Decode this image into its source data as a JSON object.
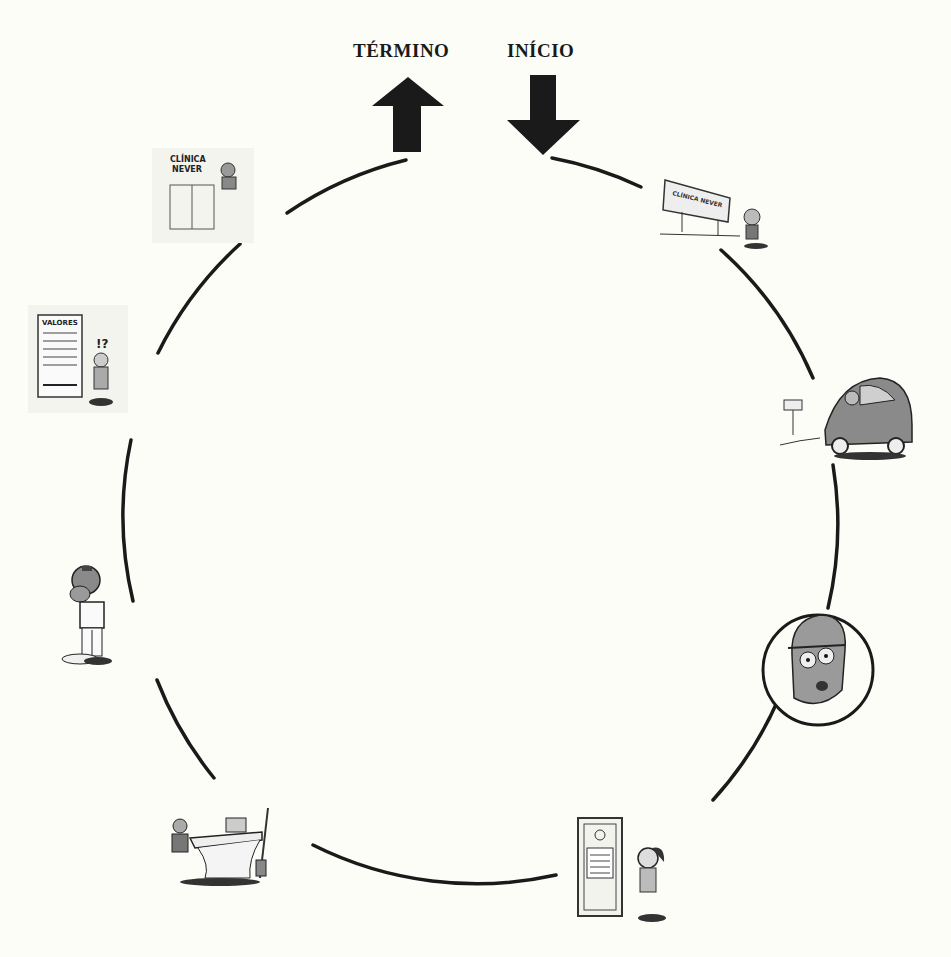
{
  "diagram": {
    "type": "cycle",
    "labels": {
      "end": "TÉRMINO",
      "start": "INÍCIO"
    },
    "circle": {
      "cx": 483,
      "cy": 517,
      "r": 365,
      "stroke": "#1a1a1a"
    },
    "steps": [
      {
        "id": 1,
        "name": "billboard",
        "caption_text": "CLÍNICA NEVER",
        "description": "Man looks at Clínica Never billboard"
      },
      {
        "id": 2,
        "name": "car-arrival",
        "caption_text": "",
        "description": "Man drives car toward parking sign"
      },
      {
        "id": 3,
        "name": "worried-face",
        "caption_text": "",
        "description": "Close-up of worried face in circle"
      },
      {
        "id": 4,
        "name": "waiting-door",
        "caption_text": "",
        "description": "Anxious man waits at office door with notice"
      },
      {
        "id": 5,
        "name": "reception-desk",
        "caption_text": "",
        "description": "Receptionist sitting at desk"
      },
      {
        "id": 6,
        "name": "dentist-standing",
        "caption_text": "",
        "description": "Professional standing with head lamp"
      },
      {
        "id": 7,
        "name": "price-board",
        "caption_text": "VALORES",
        "description": "Man shocked by price board"
      },
      {
        "id": 8,
        "name": "clinic-entrance",
        "caption_text": "CLÍNICA NEVER",
        "description": "Man leaves from Clínica Never entrance"
      }
    ],
    "colors": {
      "ink": "#1a1a1a",
      "background": "#fdfdf8",
      "gray": "#9a9a9a"
    }
  }
}
